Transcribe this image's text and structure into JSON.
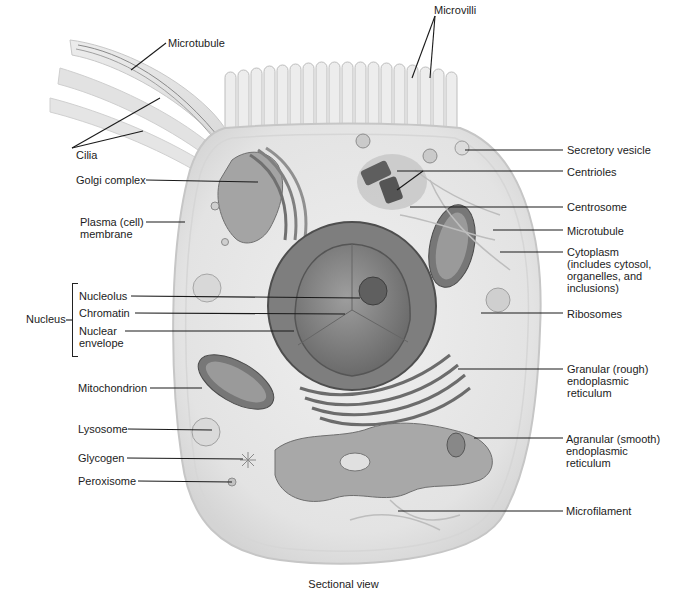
{
  "figure": {
    "caption": "Sectional view",
    "colors": {
      "background": "#ffffff",
      "cell_body": "#e6e6e6",
      "membrane": "#d2d2d2",
      "organelle_dark": "#6e6e6e",
      "organelle_mid": "#9a9a9a",
      "nucleus_envelope": "#5a5a5a",
      "nucleoplasm": "#8c8c8c",
      "leader_line": "#1a1a1a",
      "text": "#1c1c1c"
    }
  },
  "labels": {
    "left": {
      "microtubule_top": "Microtubule",
      "cilia": "Cilia",
      "golgi": "Golgi complex",
      "plasma_membrane": "Plasma (cell)\nmembrane",
      "nucleus_group": "Nucleus",
      "nucleolus": "Nucleolus",
      "chromatin": "Chromatin",
      "nuclear_envelope": "Nuclear\nenvelope",
      "mitochondrion": "Mitochondrion",
      "lysosome": "Lysosome",
      "glycogen": "Glycogen",
      "peroxisome": "Peroxisome"
    },
    "top": {
      "microvilli": "Microvilli"
    },
    "right": {
      "secretory_vesicle": "Secretory vesicle",
      "centrioles": "Centrioles",
      "centrosome": "Centrosome",
      "microtubule": "Microtubule",
      "cytoplasm": "Cytoplasm\n(includes cytosol,\norganelles, and\ninclusions)",
      "ribosomes": "Ribosomes",
      "rough_er": "Granular (rough)\nendoplasmic\nreticulum",
      "smooth_er": "Agranular (smooth)\nendoplasmic\nreticulum",
      "microfilament": "Microfilament"
    }
  }
}
